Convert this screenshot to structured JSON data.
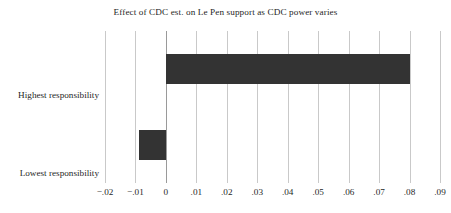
{
  "chart_data": {
    "type": "bar",
    "orientation": "horizontal",
    "title": "Effect of CDC est. on Le Pen support as CDC power varies",
    "xlabel": "",
    "ylabel": "",
    "categories": [
      "Highest responsibility",
      "Lowest responsibility"
    ],
    "values": [
      0.08,
      -0.009
    ],
    "xlim": [
      -0.02,
      0.09
    ],
    "ylim": [
      0,
      2
    ],
    "xticks": [
      -0.02,
      -0.01,
      0,
      0.01,
      0.02,
      0.03,
      0.04,
      0.05,
      0.06,
      0.07,
      0.08,
      0.09
    ],
    "xtick_labels": [
      "−.02",
      "−.01",
      "0",
      ".01",
      ".02",
      ".03",
      ".04",
      ".05",
      ".06",
      ".07",
      ".08",
      ".09"
    ],
    "grid": true,
    "grid_axis": "x",
    "legend": null,
    "bar_color": "#333333",
    "gridline_color": "#c9c9c9",
    "zeroline_color": "#9a9a9a",
    "background_color": "#ffffff",
    "series": [
      {
        "name": "Effect of CDC est. on Le Pen support",
        "points": [
          {
            "category": "Highest responsibility",
            "value": 0.08
          },
          {
            "category": "Lowest responsibility",
            "value": -0.009
          }
        ]
      }
    ]
  }
}
